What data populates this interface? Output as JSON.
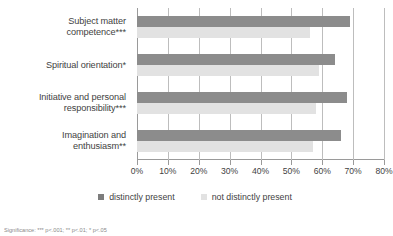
{
  "chart_data": {
    "type": "bar",
    "orientation": "horizontal",
    "title": "",
    "xlabel": "",
    "ylabel": "",
    "xlim": [
      0,
      80
    ],
    "xtick_step": 10,
    "grid": true,
    "legend_position": "bottom",
    "categories": [
      "Subject matter competence***",
      "Spiritual orientation*",
      "Initiative and personal responsibility***",
      "Imagination and enthusiasm**"
    ],
    "tick_labels": [
      "0%",
      "10%",
      "20%",
      "30%",
      "40%",
      "50%",
      "60%",
      "70%",
      "80%"
    ],
    "tick_values": [
      0,
      10,
      20,
      30,
      40,
      50,
      60,
      70,
      80
    ],
    "series": [
      {
        "name": "distinctly present",
        "color": "#8c8c8c",
        "values": [
          69,
          64,
          68,
          66
        ]
      },
      {
        "name": "not distinctly present",
        "color": "#e2e2e2",
        "values": [
          56,
          59,
          58,
          57
        ]
      }
    ]
  },
  "category_lines": [
    [
      "Subject matter",
      "competence***"
    ],
    [
      "Spiritual orientation*"
    ],
    [
      "Initiative and personal",
      "responsibility***"
    ],
    [
      "Imagination and",
      "enthusiasm**"
    ]
  ],
  "legend": {
    "items": [
      {
        "label": "distinctly present",
        "swatch": "dark"
      },
      {
        "label": "not distinctly present",
        "swatch": "light"
      }
    ]
  },
  "footnote": {
    "text": "Significance: *** p<.001; ** p<.01; * p<.05"
  }
}
